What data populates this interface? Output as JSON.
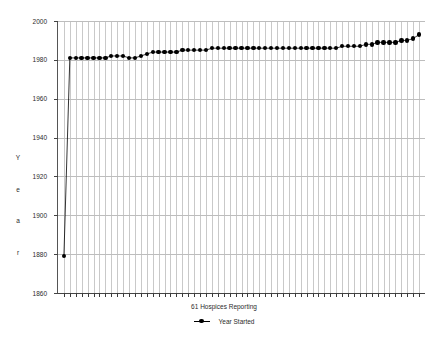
{
  "chart_data": {
    "type": "line",
    "title": "",
    "xlabel": "61 Hospices Reporting",
    "ylabel": "Year",
    "ylim": [
      1860,
      2000
    ],
    "xlim": [
      0,
      62
    ],
    "grid": true,
    "legend_position": "bottom",
    "series": [
      {
        "name": "Year Started",
        "marker": "filled-circle",
        "color": "#000000",
        "x": [
          1,
          2,
          3,
          4,
          5,
          6,
          7,
          8,
          9,
          10,
          11,
          12,
          13,
          14,
          15,
          16,
          17,
          18,
          19,
          20,
          21,
          22,
          23,
          24,
          25,
          26,
          27,
          28,
          29,
          30,
          31,
          32,
          33,
          34,
          35,
          36,
          37,
          38,
          39,
          40,
          41,
          42,
          43,
          44,
          45,
          46,
          47,
          48,
          49,
          50,
          51,
          52,
          53,
          54,
          55,
          56,
          57,
          58,
          59,
          60,
          61
        ],
        "values": [
          1879,
          1981,
          1981,
          1981,
          1981,
          1981,
          1981,
          1981,
          1982,
          1982,
          1982,
          1981,
          1981,
          1982,
          1983,
          1984,
          1984,
          1984,
          1984,
          1984,
          1985,
          1985,
          1985,
          1985,
          1985,
          1986,
          1986,
          1986,
          1986,
          1986,
          1986,
          1986,
          1986,
          1986,
          1986,
          1986,
          1986,
          1986,
          1986,
          1986,
          1986,
          1986,
          1986,
          1986,
          1986,
          1986,
          1986,
          1987,
          1987,
          1987,
          1987,
          1988,
          1988,
          1989,
          1989,
          1989,
          1989,
          1990,
          1990,
          1991,
          1993
        ]
      }
    ],
    "y_ticks": [
      2000,
      1980,
      1960,
      1940,
      1920,
      1900,
      1880,
      1860
    ],
    "y_tick_labels": [
      "2000",
      "1980",
      "1960",
      "1940",
      "1920",
      "1900",
      "1880",
      "1860"
    ],
    "x_tick_count": 61,
    "legend": [
      {
        "label": "Year Started",
        "marker": "filled-circle",
        "color": "#000000"
      }
    ]
  },
  "axis": {
    "y_title_letters": [
      "Y",
      "e",
      "a",
      "r"
    ]
  }
}
